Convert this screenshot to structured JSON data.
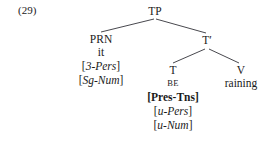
{
  "example": {
    "number": "(29)"
  },
  "tree": {
    "root": {
      "label": "TP"
    },
    "left": {
      "label": "PRN",
      "terminal": "it",
      "features": [
        {
          "open": "[",
          "text": "3-Pers",
          "close": "]"
        },
        {
          "open": "[",
          "text": "Sg-Num",
          "close": "]"
        }
      ]
    },
    "right": {
      "label": "T′"
    },
    "right_left": {
      "label": "T",
      "terminal": "BE",
      "features": [
        {
          "open": "[",
          "text": "Pres-Tns",
          "close": "]"
        },
        {
          "open": "[",
          "text": "u-Pers",
          "close": "]"
        },
        {
          "open": "[",
          "text": "u-Num",
          "close": "]"
        }
      ]
    },
    "right_right": {
      "label": "V",
      "terminal": "raining"
    }
  },
  "style": {
    "line_color": "#33333a",
    "text_color": "#1a1a1a",
    "background": "#ffffff"
  }
}
